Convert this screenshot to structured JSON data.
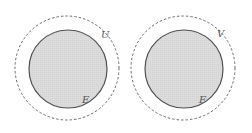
{
  "diagram": {
    "colors": {
      "fill": "#dcdcdc",
      "stroke": "#505050",
      "dashed_stroke": "#6a6a6a",
      "label": "#555555",
      "background": "#ffffff"
    },
    "groups": [
      {
        "outer_label": "U",
        "inner_label": "E",
        "outer": {
          "cx": 67,
          "cy": 68,
          "r": 52,
          "style": "dashed"
        },
        "inner": {
          "cx": 68,
          "cy": 69,
          "r": 39,
          "style": "solid-filled"
        },
        "outer_label_pos": {
          "x": 101,
          "y": 38
        },
        "inner_label_pos": {
          "x": 82,
          "y": 103
        }
      },
      {
        "outer_label": "V",
        "inner_label": "F",
        "outer": {
          "cx": 183,
          "cy": 68,
          "r": 52,
          "style": "dashed"
        },
        "inner": {
          "cx": 184,
          "cy": 69,
          "r": 39,
          "style": "solid-filled"
        },
        "outer_label_pos": {
          "x": 217,
          "y": 37
        },
        "inner_label_pos": {
          "x": 199,
          "y": 103
        }
      }
    ]
  }
}
